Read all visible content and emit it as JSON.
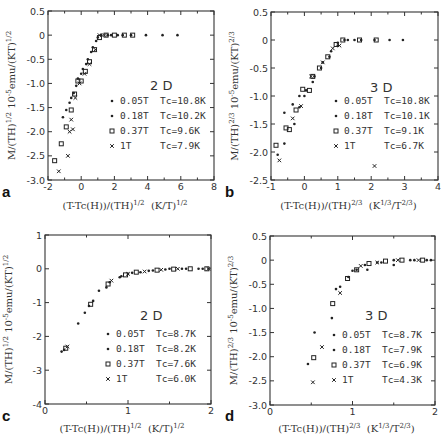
{
  "chart_data": [
    {
      "panel": "a",
      "type": "scatter",
      "dimension_label": "2 D",
      "xlabel": "(T-Tc(H))/(TH)^1/2  (K/T)^1/2",
      "ylabel": "M/(TH)^1/2 10^-5emu/(KT)^1/2",
      "xlim": [
        -2,
        8
      ],
      "ylim": [
        -3.0,
        0.5
      ],
      "xticks": [
        "-2",
        "0",
        "2",
        "4",
        "6",
        "8"
      ],
      "yticks": [
        "0.5",
        "0",
        "-0.5",
        "-1.0",
        "-1.5",
        "-2.0",
        "-2.5",
        "-3.0"
      ],
      "legend": [
        {
          "field": "0.05T",
          "tc": "Tc=10.8K",
          "marker": "dot"
        },
        {
          "field": "0.18T",
          "tc": "Tc=10.2K",
          "marker": "dot"
        },
        {
          "field": "0.37T",
          "tc": "Tc=9.6K",
          "marker": "square"
        },
        {
          "field": "1T",
          "tc": "Tc=7.9K",
          "marker": "cross"
        }
      ],
      "series": [
        {
          "name": "0.05T",
          "marker": "dot",
          "points": [
            [
              -1.1,
              -1.7
            ],
            [
              -0.7,
              -1.4
            ],
            [
              -0.45,
              -1.2
            ],
            [
              -0.2,
              -0.9
            ],
            [
              0.1,
              -0.7
            ],
            [
              0.4,
              -0.5
            ],
            [
              0.7,
              -0.25
            ],
            [
              1.0,
              -0.05
            ],
            [
              1.2,
              0
            ],
            [
              1.6,
              0
            ],
            [
              2.2,
              0
            ],
            [
              3.0,
              0
            ],
            [
              3.9,
              0
            ],
            [
              4.9,
              0
            ],
            [
              5.8,
              0
            ]
          ]
        },
        {
          "name": "0.18T",
          "marker": "dot",
          "points": [
            [
              -0.9,
              -1.55
            ],
            [
              -0.6,
              -1.3
            ],
            [
              -0.3,
              -1.05
            ],
            [
              0.0,
              -0.8
            ],
            [
              0.3,
              -0.6
            ],
            [
              0.6,
              -0.35
            ],
            [
              0.9,
              -0.12
            ],
            [
              1.2,
              0
            ],
            [
              1.8,
              0
            ],
            [
              2.5,
              0
            ]
          ]
        },
        {
          "name": "0.37T",
          "marker": "square",
          "points": [
            [
              -1.6,
              -2.6
            ],
            [
              -1.2,
              -2.25
            ],
            [
              -0.9,
              -1.9
            ],
            [
              -0.6,
              -1.55
            ],
            [
              -0.4,
              -1.22
            ],
            [
              -0.2,
              -0.95
            ],
            [
              0.0,
              -0.95
            ],
            [
              0.25,
              -0.75
            ],
            [
              0.5,
              -0.55
            ],
            [
              0.8,
              -0.3
            ],
            [
              1.1,
              -0.05
            ],
            [
              1.5,
              0
            ],
            [
              2.0,
              0
            ],
            [
              2.6,
              0
            ],
            [
              3.1,
              0
            ]
          ]
        },
        {
          "name": "1T",
          "marker": "cross",
          "points": [
            [
              -1.35,
              -2.82
            ],
            [
              -0.8,
              -2.5
            ],
            [
              -0.7,
              -2.0
            ],
            [
              -0.5,
              -1.95
            ],
            [
              -0.6,
              -1.75
            ],
            [
              -0.35,
              -1.3
            ],
            [
              -0.1,
              -1.0
            ],
            [
              0.2,
              -0.8
            ],
            [
              0.5,
              -0.6
            ],
            [
              0.85,
              -0.3
            ],
            [
              1.1,
              0
            ],
            [
              1.4,
              0
            ]
          ]
        }
      ]
    },
    {
      "panel": "b",
      "type": "scatter",
      "dimension_label": "3 D",
      "xlabel": "(T-Tc(H))/(TH)^2/3  (K^1/3/T^2/3)",
      "ylabel": "M/(TH)^2/3 10^-5emu/(KT)^2/3",
      "xlim": [
        -1,
        4
      ],
      "ylim": [
        -2.5,
        0.5
      ],
      "xticks": [
        "-1",
        "0",
        "1",
        "2",
        "3",
        "4"
      ],
      "yticks": [
        "0.5",
        "0",
        "-0.5",
        "-1.0",
        "-1.5",
        "-2.0",
        "-2.5"
      ],
      "legend": [
        {
          "field": "0.05T",
          "tc": "Tc=10.8K",
          "marker": "dot"
        },
        {
          "field": "0.18T",
          "tc": "Tc=10.1K",
          "marker": "dot"
        },
        {
          "field": "0.37T",
          "tc": "Tc=9.1K",
          "marker": "square"
        },
        {
          "field": "1T",
          "tc": "Tc=6.7K",
          "marker": "cross"
        }
      ],
      "series": [
        {
          "name": "0.05T",
          "marker": "dot",
          "points": [
            [
              -0.6,
              -1.3
            ],
            [
              -0.35,
              -1.15
            ],
            [
              -0.15,
              -1.0
            ],
            [
              0.05,
              -0.9
            ],
            [
              0.3,
              -0.65
            ],
            [
              0.55,
              -0.4
            ],
            [
              0.8,
              -0.2
            ],
            [
              1.0,
              -0.05
            ],
            [
              1.3,
              0
            ],
            [
              1.7,
              0
            ],
            [
              2.1,
              0
            ],
            [
              2.55,
              0
            ],
            [
              2.95,
              0
            ]
          ]
        },
        {
          "name": "0.18T",
          "marker": "dot",
          "points": [
            [
              -0.8,
              -2.05
            ],
            [
              -0.6,
              -1.85
            ],
            [
              -0.3,
              -1.5
            ],
            [
              -0.15,
              -1.2
            ],
            [
              0.0,
              -1.0
            ],
            [
              0.25,
              -0.75
            ],
            [
              0.5,
              -0.5
            ],
            [
              0.75,
              -0.3
            ],
            [
              1.0,
              -0.1
            ],
            [
              1.2,
              0
            ],
            [
              1.5,
              0
            ]
          ]
        },
        {
          "name": "0.37T",
          "marker": "square",
          "points": [
            [
              -0.85,
              -1.88
            ],
            [
              -0.55,
              -1.57
            ],
            [
              -0.45,
              -1.6
            ],
            [
              -0.25,
              -1.25
            ],
            [
              -0.05,
              -0.88
            ],
            [
              0.15,
              -0.9
            ],
            [
              0.25,
              -0.65
            ],
            [
              0.45,
              -0.5
            ],
            [
              0.7,
              -0.3
            ],
            [
              0.95,
              -0.08
            ],
            [
              1.15,
              0
            ],
            [
              1.65,
              0
            ],
            [
              2.15,
              0
            ]
          ]
        },
        {
          "name": "1T",
          "marker": "cross",
          "points": [
            [
              -0.75,
              -2.15
            ],
            [
              -0.35,
              -1.4
            ],
            [
              -0.1,
              -1.18
            ],
            [
              0.2,
              -0.65
            ],
            [
              0.55,
              -0.4
            ],
            [
              0.85,
              -0.15
            ],
            [
              1.05,
              -0.1
            ],
            [
              2.1,
              -2.25
            ]
          ]
        }
      ]
    },
    {
      "panel": "c",
      "type": "scatter",
      "dimension_label": "2 D",
      "xlabel": "(T-Tc(H))/(TH)^1/2  (K/T)^1/2",
      "ylabel": "M/(TH)^1/2 10^-5emu/(KT)^1/2",
      "xlim": [
        0,
        2
      ],
      "ylim": [
        -4,
        1
      ],
      "xticks": [
        "0",
        "1",
        "2"
      ],
      "yticks": [
        "1",
        "0",
        "-1",
        "-2",
        "-3",
        "-4"
      ],
      "legend": [
        {
          "field": "0.05T",
          "tc": "Tc=8.7K",
          "marker": "dot"
        },
        {
          "field": "0.18T",
          "tc": "Tc=8.2K",
          "marker": "dot"
        },
        {
          "field": "0.37T",
          "tc": "Tc=7.6K",
          "marker": "square"
        },
        {
          "field": "1T",
          "tc": "Tc=6.0K",
          "marker": "cross"
        }
      ],
      "series": [
        {
          "name": "0.05T",
          "marker": "dot",
          "points": [
            [
              0.2,
              -2.45
            ],
            [
              0.4,
              -1.62
            ],
            [
              0.53,
              -1.1
            ],
            [
              0.65,
              -0.65
            ],
            [
              0.78,
              -0.4
            ],
            [
              0.9,
              -0.25
            ],
            [
              1.0,
              -0.15
            ],
            [
              1.15,
              -0.1
            ],
            [
              1.3,
              -0.05
            ],
            [
              1.5,
              0
            ],
            [
              1.7,
              0
            ],
            [
              1.9,
              0
            ]
          ]
        },
        {
          "name": "0.18T",
          "marker": "dot",
          "points": [
            [
              0.23,
              -2.4
            ],
            [
              0.48,
              -1.3
            ],
            [
              0.58,
              -0.95
            ],
            [
              0.74,
              -0.55
            ],
            [
              0.92,
              -0.22
            ],
            [
              1.05,
              -0.12
            ],
            [
              1.25,
              -0.06
            ],
            [
              1.45,
              -0.02
            ],
            [
              1.65,
              0
            ],
            [
              1.85,
              0
            ]
          ]
        },
        {
          "name": "0.37T",
          "marker": "square",
          "points": [
            [
              0.25,
              -2.35
            ],
            [
              0.55,
              -1.05
            ],
            [
              0.76,
              -0.45
            ],
            [
              0.97,
              -0.18
            ],
            [
              1.1,
              -0.1
            ],
            [
              1.35,
              -0.04
            ],
            [
              1.55,
              -0.01
            ],
            [
              1.75,
              0
            ],
            [
              1.95,
              0
            ]
          ]
        },
        {
          "name": "1T",
          "marker": "cross",
          "points": [
            [
              0.27,
              -2.3
            ],
            [
              0.8,
              -0.35
            ],
            [
              1.0,
              -0.15
            ],
            [
              1.2,
              -0.08
            ],
            [
              1.4,
              -0.03
            ],
            [
              1.6,
              0
            ],
            [
              1.97,
              0
            ]
          ]
        }
      ]
    },
    {
      "panel": "d",
      "type": "scatter",
      "dimension_label": "3 D",
      "xlabel": "(T-Tc(H))/(TH)^2/3  (K^1/3/T^2/3)",
      "ylabel": "M/(TH)^2/3 10^-5emu/(KT)^2/3",
      "xlim": [
        0,
        2
      ],
      "ylim": [
        -3.0,
        0.5
      ],
      "xticks": [
        "0",
        "1",
        "2"
      ],
      "yticks": [
        "0.5",
        "0",
        "-0.5",
        "-1.0",
        "-1.5",
        "-2.0",
        "-2.5",
        "-3.0"
      ],
      "legend": [
        {
          "field": "0.05T",
          "tc": "Tc=8.7K",
          "marker": "dot"
        },
        {
          "field": "0.18T",
          "tc": "Tc=7.9K",
          "marker": "dot"
        },
        {
          "field": "0.37T",
          "tc": "Tc=6.9K",
          "marker": "square"
        },
        {
          "field": "1T",
          "tc": "Tc=4.3K",
          "marker": "cross"
        }
      ],
      "series": [
        {
          "name": "0.05T",
          "marker": "dot",
          "points": [
            [
              0.54,
              -1.5
            ],
            [
              0.8,
              -0.6
            ],
            [
              0.95,
              -0.35
            ],
            [
              1.05,
              -0.2
            ],
            [
              1.15,
              -0.1
            ],
            [
              1.3,
              -0.05
            ],
            [
              1.5,
              0
            ],
            [
              1.7,
              0
            ],
            [
              1.9,
              0
            ]
          ]
        },
        {
          "name": "0.18T",
          "marker": "dot",
          "points": [
            [
              0.46,
              -2.15
            ],
            [
              0.75,
              -1.2
            ],
            [
              0.85,
              -0.55
            ],
            [
              1.0,
              -0.22
            ],
            [
              1.18,
              -0.2
            ],
            [
              1.35,
              -0.05
            ],
            [
              1.5,
              -0.1
            ],
            [
              1.75,
              0
            ],
            [
              1.95,
              0
            ]
          ]
        },
        {
          "name": "0.37T",
          "marker": "square",
          "points": [
            [
              0.53,
              -2.02
            ],
            [
              0.76,
              -0.9
            ],
            [
              0.94,
              -0.38
            ],
            [
              1.05,
              -0.2
            ],
            [
              1.2,
              -0.07
            ],
            [
              1.4,
              -0.02
            ],
            [
              1.6,
              0
            ],
            [
              1.85,
              0
            ]
          ]
        },
        {
          "name": "1T",
          "marker": "cross",
          "points": [
            [
              0.52,
              -2.53
            ],
            [
              0.63,
              -1.8
            ],
            [
              0.85,
              -0.68
            ],
            [
              1.1,
              -0.12
            ],
            [
              1.3,
              -0.05
            ],
            [
              1.55,
              0
            ],
            [
              1.8,
              0
            ]
          ]
        }
      ]
    }
  ],
  "panels": {
    "a": {
      "letter": "a",
      "dim": "2 D",
      "xunit": "(K/T)",
      "xunit_exp": "1/2",
      "xexpr": "(T-Tc(H))/(TH)",
      "xexpr_exp": "1/2",
      "ylabel_main": "M/(TH)",
      "ylabel_exp1": "1/2",
      "ylabel_mid": " 10",
      "ylabel_exp2": "-5",
      "ylabel_end": "emu/(KT)",
      "ylabel_exp3": "1/2"
    },
    "b": {
      "letter": "b",
      "dim": "3 D",
      "xunit": "(K",
      "xunit_exp": "1/3",
      "xunit_mid": "/T",
      "xunit_exp2": "2/3",
      "xunit_end": ")",
      "xexpr": "(T-Tc(H))/(TH)",
      "xexpr_exp": "2/3",
      "ylabel_main": "M/(TH)",
      "ylabel_exp1": "2/3",
      "ylabel_mid": " 10",
      "ylabel_exp2": "-5",
      "ylabel_end": "emu/(KT)",
      "ylabel_exp3": "2/3"
    },
    "c": {
      "letter": "c",
      "dim": "2 D",
      "xunit": "(K/T)",
      "xunit_exp": "1/2",
      "xexpr": "(T-Tc(H))/(TH)",
      "xexpr_exp": "1/2",
      "ylabel_main": "M/(TH)",
      "ylabel_exp1": "1/2",
      "ylabel_mid": " 10",
      "ylabel_exp2": "-5",
      "ylabel_end": "emu/(KT)",
      "ylabel_exp3": "1/2"
    },
    "d": {
      "letter": "d",
      "dim": "3 D",
      "xunit": "(K",
      "xunit_exp": "1/3",
      "xunit_mid": "/T",
      "xunit_exp2": "2/3",
      "xunit_end": ")",
      "xexpr": "(T-Tc(H))/(TH)",
      "xexpr_exp": "2/3",
      "ylabel_main": "M/(TH)",
      "ylabel_exp1": "2/3",
      "ylabel_mid": " 10",
      "ylabel_exp2": "-5",
      "ylabel_end": "emu/(KT)",
      "ylabel_exp3": "2/3"
    }
  },
  "colors": {
    "axis": "#333333",
    "marker": "#222222",
    "background": "#ffffff"
  }
}
